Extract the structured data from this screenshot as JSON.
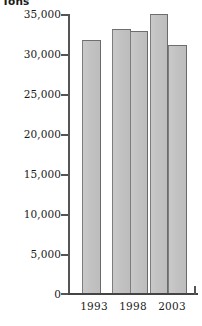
{
  "chart_data": {
    "type": "bar",
    "title": "",
    "ylabel": "Tons",
    "xlabel": "",
    "ylim": [
      0,
      35000
    ],
    "grid": false,
    "legend": null,
    "y_ticks": [
      {
        "value": 35000,
        "label": "35,000"
      },
      {
        "value": 30000,
        "label": "30,000"
      },
      {
        "value": 25000,
        "label": "25,000"
      },
      {
        "value": 20000,
        "label": "20,000"
      },
      {
        "value": 15000,
        "label": "15,000"
      },
      {
        "value": 10000,
        "label": "10,000"
      },
      {
        "value": 5000,
        "label": "5,000"
      },
      {
        "value": 0,
        "label": "0"
      }
    ],
    "x_tick_labels": [
      "1993",
      "1998",
      "2003"
    ],
    "categories": [
      "",
      "1993",
      "",
      "1998",
      "2003"
    ],
    "values": [
      31800,
      33100,
      32900,
      35000,
      31100
    ],
    "bars": [
      {
        "label": "",
        "value": 31800
      },
      {
        "label": "1993",
        "value": 33100
      },
      {
        "label": "",
        "value": 32900
      },
      {
        "label": "1998",
        "value": 35000
      },
      {
        "label": "2003",
        "value": 31100
      }
    ],
    "bar_fill_color": "#c4c4c4",
    "bar_edge_color": "#6e6e6e",
    "axis_color": "#555555",
    "background_color": "#ffffff"
  },
  "axis": {
    "unit_label": "Tons"
  }
}
